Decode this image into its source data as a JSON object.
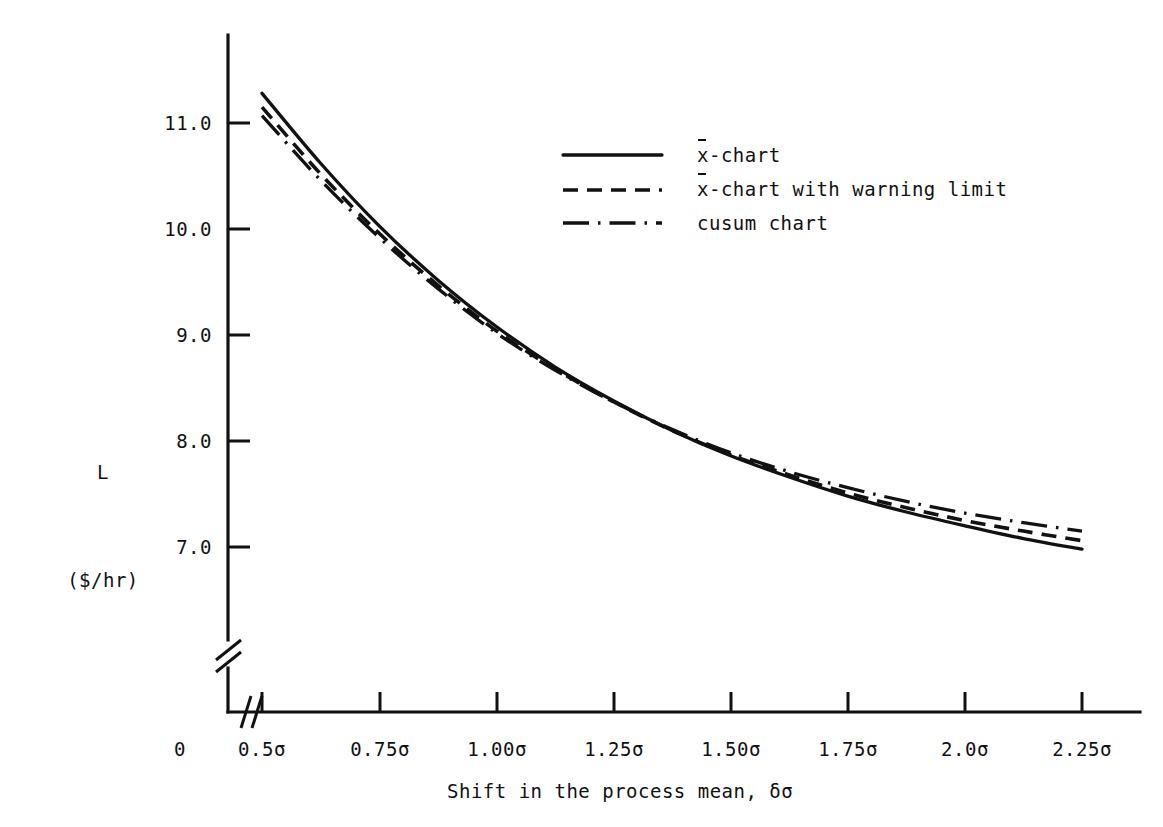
{
  "chart_data": {
    "type": "line",
    "title": "",
    "xlabel": "Shift in the process mean, δσ",
    "ylabel": "L ($/hr)",
    "ylabel_lines": [
      "L",
      "($/hr)"
    ],
    "xtick_labels": [
      "0",
      "0.5σ",
      "0.75σ",
      "1.00σ",
      "1.25σ",
      "1.50σ",
      "1.75σ",
      "2.0σ",
      "2.25σ"
    ],
    "ytick_labels": [
      "7.0",
      "8.0",
      "9.0",
      "10.0",
      "11.0"
    ],
    "ytick_values": [
      7.0,
      8.0,
      9.0,
      10.0,
      11.0
    ],
    "xlim_labels": [
      0.5,
      2.25
    ],
    "ylim": [
      6.9,
      11.4
    ],
    "grid": false,
    "axis_break_y": true,
    "axis_break_x": true,
    "legend_position": "upper-right-inside",
    "x": [
      0.5,
      0.625,
      0.75,
      0.875,
      1.0,
      1.125,
      1.25,
      1.375,
      1.5,
      1.625,
      1.75,
      1.875,
      2.0,
      2.125,
      2.25
    ],
    "series": [
      {
        "name": "x̄-chart",
        "style": "solid",
        "values": [
          11.28,
          10.62,
          10.03,
          9.52,
          9.08,
          8.7,
          8.38,
          8.1,
          7.86,
          7.66,
          7.48,
          7.33,
          7.2,
          7.08,
          6.98
        ]
      },
      {
        "name": "x̄-chart with warning limit",
        "style": "dashed",
        "values": [
          11.15,
          10.52,
          9.96,
          9.47,
          9.04,
          8.68,
          8.37,
          8.1,
          7.87,
          7.68,
          7.51,
          7.37,
          7.25,
          7.15,
          7.06
        ]
      },
      {
        "name": "cusum chart",
        "style": "dash-dot",
        "values": [
          11.07,
          10.46,
          9.92,
          9.44,
          9.02,
          8.67,
          8.37,
          8.11,
          7.89,
          7.71,
          7.56,
          7.43,
          7.32,
          7.23,
          7.15
        ]
      }
    ]
  },
  "legend": {
    "items": [
      {
        "label_prefix": "x",
        "label_suffix": "-chart",
        "overbar": true,
        "style": "solid",
        "sample_name": "legend-line-solid"
      },
      {
        "label_prefix": "x",
        "label_suffix": "-chart with warning limit",
        "overbar": true,
        "style": "dashed",
        "sample_name": "legend-line-dashed"
      },
      {
        "label_prefix": "c",
        "label_suffix": "usum chart",
        "overbar": false,
        "style": "dash-dot",
        "sample_name": "legend-line-dashdot"
      }
    ]
  },
  "axes": {
    "y_title_line1": "L",
    "y_title_line2": "($/hr)",
    "x_title": "Shift in the process mean, δσ",
    "origin_label": "0"
  }
}
